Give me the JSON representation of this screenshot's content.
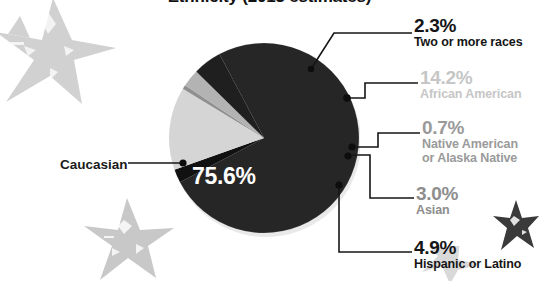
{
  "title": "Ethnicity (2013 estimates)",
  "colors": {
    "caucasian": "#262626",
    "african_american": "#d5d5d5",
    "native_american": "#8f8f8f",
    "asian": "#b3b3b3",
    "hispanic": "#1f1f1f",
    "two_or_more": "#111111",
    "background": "#ffffff",
    "label_dark": "#151515",
    "label_light": "#c6c6c6",
    "label_mid": "#9a9a9a",
    "star_light": "#cfcfcf",
    "star_dark": "#3a3a3a",
    "leader_line": "#161616"
  },
  "center_label": {
    "value": "75.6%"
  },
  "left_label": {
    "text": "Caucasian"
  },
  "callouts": [
    {
      "pct": "2.3%",
      "name": "Two or more races"
    },
    {
      "pct": "14.2%",
      "name": "African American"
    },
    {
      "pct": "0.7%",
      "name": "Native American",
      "name2": "or Alaska Native"
    },
    {
      "pct": "3.0%",
      "name": "Asian"
    },
    {
      "pct": "4.9%",
      "name": "Hispanic or Latino"
    }
  ],
  "chart_data": {
    "type": "pie",
    "title": "Ethnicity (2013 estimates)",
    "labels": [
      "Caucasian",
      "Two or more races",
      "African American",
      "Native American or Alaska Native",
      "Asian",
      "Hispanic or Latino"
    ],
    "values": [
      75.6,
      2.3,
      14.2,
      0.7,
      3.0,
      4.9
    ],
    "value_labels": [
      "75.6%",
      "2.3%",
      "14.2%",
      "0.7%",
      "3.0%",
      "4.9%"
    ],
    "slice_colors": [
      "#262626",
      "#111111",
      "#d5d5d5",
      "#8f8f8f",
      "#b3b3b3",
      "#1f1f1f"
    ],
    "units": "percent",
    "legend": "callout-labels",
    "grid": false,
    "total": 100.7
  }
}
